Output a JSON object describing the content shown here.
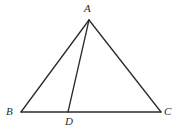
{
  "figure": {
    "background_color": "#ffffff",
    "stroke_color": "#2b2b2b",
    "stroke_width": 1.3,
    "label_color": "#2b2b2b",
    "points": {
      "A": {
        "label": "A",
        "x": 89,
        "y": 20
      },
      "B": {
        "label": "B",
        "x": 21,
        "y": 112
      },
      "C": {
        "label": "C",
        "x": 161,
        "y": 112
      },
      "D": {
        "label": "D",
        "x": 68,
        "y": 112
      }
    },
    "segments": [
      {
        "name": "segment-AB",
        "from": "A",
        "to": "B"
      },
      {
        "name": "segment-AC",
        "from": "A",
        "to": "C"
      },
      {
        "name": "segment-AD",
        "from": "A",
        "to": "D"
      },
      {
        "name": "segment-BC",
        "from": "B",
        "to": "C"
      }
    ]
  }
}
